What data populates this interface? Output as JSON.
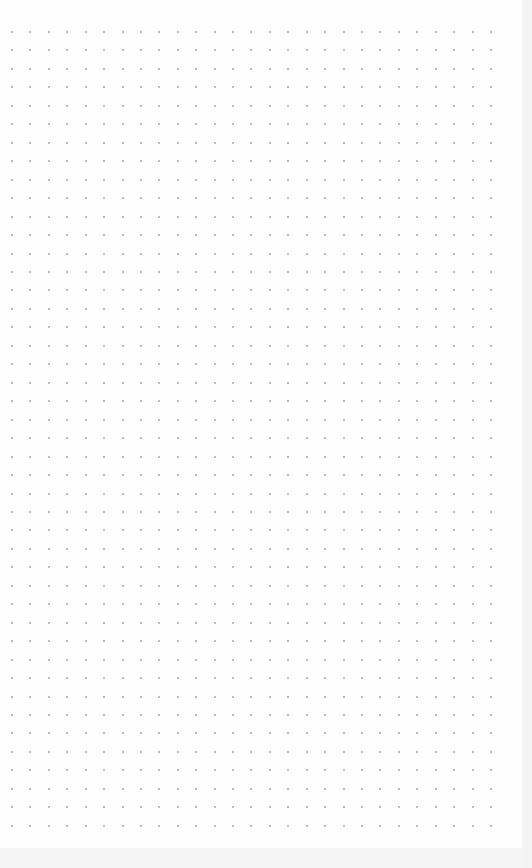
{
  "canvas": {
    "background": "dot-grid",
    "dot_color": "#a6a6a6",
    "columns": 27,
    "rows": 44,
    "origin_x": 12,
    "origin_y": 32,
    "spacing_x": 18.42,
    "spacing_y": 18.46
  }
}
